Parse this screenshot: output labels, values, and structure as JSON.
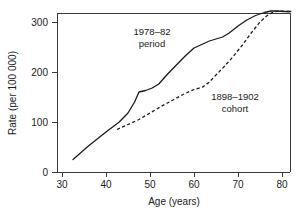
{
  "chart_data": {
    "type": "line",
    "title": "",
    "subtitle": "",
    "xlabel": "Age (years)",
    "ylabel": "Rate (per 100 000)",
    "xlim": [
      29,
      84
    ],
    "ylim": [
      0,
      345
    ],
    "xticks": [
      30,
      40,
      50,
      60,
      70,
      80
    ],
    "xtick_labels": [
      "30",
      "40",
      "50",
      "60",
      "70",
      "80"
    ],
    "yticks": [
      0,
      100,
      200,
      300
    ],
    "ytick_labels": [
      "0",
      "100",
      "200",
      "300"
    ],
    "grid": false,
    "legend": "none (inline annotations)",
    "series": [
      {
        "name": "1978–82 period",
        "style": "solid",
        "x": [
          32.5,
          36,
          40,
          43,
          45,
          46.5,
          47.5,
          49,
          50.5,
          52,
          54,
          56,
          58,
          60,
          62,
          63.5,
          65,
          66.5,
          68,
          70,
          72,
          74,
          76,
          77.5,
          79,
          80.5,
          82
        ],
        "y": [
          25,
          52,
          80,
          100,
          118,
          140,
          160,
          163,
          168,
          176,
          196,
          214,
          232,
          248,
          256,
          262,
          266,
          270,
          278,
          292,
          304,
          313,
          319,
          322,
          322,
          321,
          321
        ]
      },
      {
        "name": "1898–1902 cohort",
        "style": "dashed",
        "x": [
          42.5,
          45,
          47.5,
          50,
          52.5,
          55,
          57.5,
          60,
          62,
          63.5,
          65,
          67,
          69,
          71,
          73,
          75,
          76.5,
          78,
          79.5,
          81,
          82
        ],
        "y": [
          85,
          95,
          105,
          118,
          131,
          143,
          155,
          165,
          170,
          180,
          194,
          212,
          232,
          254,
          278,
          300,
          312,
          320,
          322,
          321,
          321
        ]
      }
    ],
    "annotations": [
      {
        "id": "period-label",
        "line1": "1978–82",
        "line2": "period",
        "x_px": 152,
        "y_px": 35
      },
      {
        "id": "cohort-label",
        "line1": "1898–1902",
        "line2": "cohort",
        "x_px": 235,
        "y_px": 100
      }
    ]
  }
}
